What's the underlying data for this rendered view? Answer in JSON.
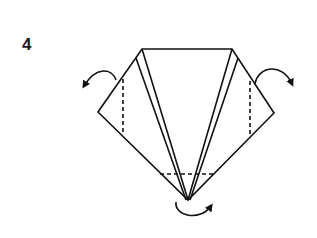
{
  "step": {
    "number": "4"
  },
  "diagram": {
    "type": "origami-fold-instruction",
    "stroke_color": "#111111",
    "background": "#ffffff",
    "elements": [
      {
        "name": "outer-outline",
        "style": "solid"
      },
      {
        "name": "inner-flap-lines",
        "style": "solid"
      },
      {
        "name": "left-valley-fold-line",
        "style": "dashed"
      },
      {
        "name": "right-valley-fold-line",
        "style": "dashed"
      },
      {
        "name": "bottom-fold-line",
        "style": "dashed"
      },
      {
        "name": "left-fold-arrow",
        "direction": "fold back left"
      },
      {
        "name": "right-fold-arrow",
        "direction": "fold back right"
      },
      {
        "name": "bottom-fold-arrow",
        "direction": "fold tip under"
      }
    ]
  }
}
